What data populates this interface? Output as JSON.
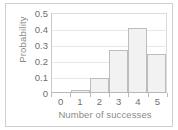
{
  "chart_data": {
    "type": "bar",
    "title": "",
    "subtitle": "",
    "xlabel": "Number of successes",
    "ylabel": "Probability",
    "categories": [
      "0",
      "1",
      "2",
      "3",
      "4",
      "5"
    ],
    "values": [
      0.0,
      0.01,
      0.09,
      0.26,
      0.4,
      0.24
    ],
    "xlim": [
      0,
      6
    ],
    "ylim": [
      0,
      0.5
    ],
    "yticks": [
      "0",
      "0.1",
      "0.2",
      "0.3",
      "0.4",
      "0.5"
    ],
    "ytick_values": [
      0,
      0.1,
      0.2,
      0.3,
      0.4,
      0.5
    ],
    "xticks": [
      "0",
      "1",
      "2",
      "3",
      "4",
      "5"
    ],
    "grid": "horizontal",
    "legend": "none",
    "annotations": []
  },
  "style": {
    "bar_fill": "#f2f2f2",
    "bar_stroke": "#bdbdbd",
    "grid_color": "#e8e8e8",
    "axis_color": "#b8b8b8",
    "tick_text_color": "#6f6f6f",
    "axis_title_color": "#8a8a8a",
    "frame_color": "#cfcfcf",
    "background": "#ffffff"
  }
}
